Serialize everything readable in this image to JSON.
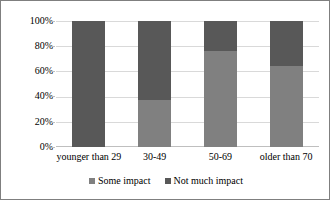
{
  "chart_data": {
    "type": "bar",
    "subtype": "stacked-100-percent",
    "title": "",
    "subtitle": "",
    "xlabel": "",
    "ylabel": "",
    "categories": [
      "younger than 29",
      "30-49",
      "50-69",
      "older than 70"
    ],
    "ylim": [
      0,
      100
    ],
    "ytick_labels": [
      "0%",
      "20%",
      "40%",
      "60%",
      "80%",
      "100%"
    ],
    "ytick_values": [
      0,
      20,
      40,
      60,
      80,
      100
    ],
    "grid": true,
    "legend_position": "bottom",
    "series": [
      {
        "name": "Some impact",
        "color": "#808080",
        "values": [
          0,
          37,
          76,
          64
        ]
      },
      {
        "name": "Not much impact",
        "color": "#585858",
        "values": [
          100,
          63,
          24,
          36
        ]
      }
    ]
  },
  "colors": {
    "some_impact": "#808080",
    "not_much_impact": "#585858",
    "gridline": "#d9d9d9",
    "axis": "#bfbfbf",
    "border": "#7f7f7f",
    "background": "#ffffff",
    "text": "#000000"
  },
  "legend": {
    "items": [
      {
        "label": "Some impact",
        "color": "#808080"
      },
      {
        "label": "Not much impact",
        "color": "#585858"
      }
    ]
  }
}
